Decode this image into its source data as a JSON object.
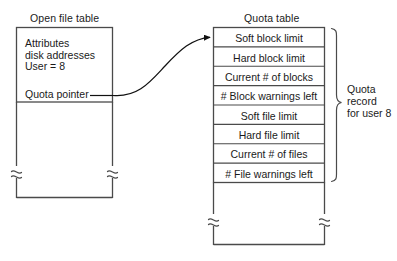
{
  "diagram": {
    "title_open_file_table": "Open file table",
    "title_quota_table": "Quota table",
    "open_file_table": {
      "entries": [
        "Attributes",
        "disk addresses",
        "User = 8"
      ],
      "pointer_label": "Quota pointer"
    },
    "quota_table": {
      "rows": [
        "Soft block limit",
        "Hard block limit",
        "Current # of blocks",
        "# Block warnings left",
        "Soft file limit",
        "Hard file limit",
        "Current # of files",
        "# File warnings left"
      ]
    },
    "brace_annotation": {
      "line1": "Quota",
      "line2": "record",
      "line3": "for user 8"
    },
    "colors": {
      "stroke": "#4a4a4a",
      "text": "#1a1a1a",
      "background": "#ffffff",
      "arrow": "#111111"
    }
  }
}
